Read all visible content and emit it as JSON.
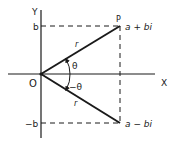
{
  "diagram": {
    "axes": {
      "x_label": "X",
      "y_label": "Y",
      "origin_label": "O"
    },
    "ticks": {
      "b": "b",
      "neg_b": "−b"
    },
    "points": {
      "P": {
        "label": "P",
        "value": "a + bi"
      },
      "conjugate": {
        "value": "a − bi"
      }
    },
    "segments": {
      "upper_r": "r",
      "lower_r": "r"
    },
    "angles": {
      "theta": "θ",
      "neg_theta": "−θ"
    },
    "colors": {
      "ink": "#1a1a1a",
      "background": "#ffffff"
    }
  }
}
